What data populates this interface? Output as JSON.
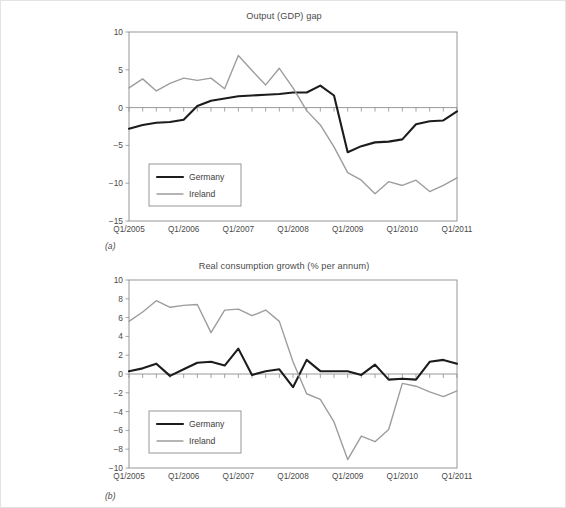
{
  "figure": {
    "panel_a_label": "(a)",
    "panel_b_label": "(b)"
  },
  "colors": {
    "germany": "#1c1c1c",
    "ireland": "#9d9d9d",
    "axis": "#8d8d8d",
    "text": "#4a4a4a",
    "background": "#ffffff"
  },
  "chart_data": [
    {
      "type": "line",
      "id": "output-gdp-gap",
      "title": "Output (GDP) gap",
      "xlabel": "",
      "ylabel": "",
      "ylim": [
        -15,
        10
      ],
      "yticks": [
        10,
        5,
        0,
        -5,
        -10,
        -15
      ],
      "ytick_labels": [
        "10",
        "5",
        "0",
        "−5",
        "−10",
        "−15"
      ],
      "grid": false,
      "legend_position": "lower-left",
      "x": [
        "Q1/2005",
        "Q2/2005",
        "Q3/2005",
        "Q4/2005",
        "Q1/2006",
        "Q2/2006",
        "Q3/2006",
        "Q4/2006",
        "Q1/2007",
        "Q2/2007",
        "Q3/2007",
        "Q4/2007",
        "Q1/2008",
        "Q2/2008",
        "Q3/2008",
        "Q4/2008",
        "Q1/2009",
        "Q2/2009",
        "Q3/2009",
        "Q4/2009",
        "Q1/2010",
        "Q2/2010",
        "Q3/2010",
        "Q4/2010",
        "Q1/2011"
      ],
      "xtick_labels": [
        "Q1/2005",
        "Q1/2006",
        "Q1/2007",
        "Q1/2008",
        "Q1/2009",
        "Q1/2010",
        "Q1/2011"
      ],
      "xtick_indices": [
        0,
        4,
        8,
        12,
        16,
        20,
        24
      ],
      "series": [
        {
          "name": "Germany",
          "color": "#1c1c1c",
          "width": 2.1,
          "values": [
            -2.8,
            -2.3,
            -2.0,
            -1.9,
            -1.6,
            0.2,
            0.9,
            1.2,
            1.5,
            1.6,
            1.7,
            1.8,
            2.0,
            2.0,
            2.9,
            1.6,
            -5.9,
            -5.1,
            -4.6,
            -4.5,
            -4.2,
            -2.2,
            -1.8,
            -1.7,
            -0.5
          ]
        },
        {
          "name": "Ireland",
          "color": "#9d9d9d",
          "width": 1.4,
          "values": [
            2.6,
            3.8,
            2.2,
            3.2,
            3.9,
            3.6,
            3.9,
            2.5,
            6.9,
            4.9,
            3.0,
            5.2,
            2.6,
            -0.4,
            -2.3,
            -5.2,
            -8.6,
            -9.6,
            -11.4,
            -9.8,
            -10.3,
            -9.6,
            -11.1,
            -10.3,
            -9.3
          ]
        }
      ],
      "legend": [
        "Germany",
        "Ireland"
      ]
    },
    {
      "type": "line",
      "id": "real-consumption-growth",
      "title": "Real consumption growth (% per annum)",
      "xlabel": "",
      "ylabel": "",
      "ylim": [
        -10,
        10
      ],
      "yticks": [
        10,
        8,
        6,
        4,
        2,
        0,
        -2,
        -4,
        -6,
        -8,
        -10
      ],
      "ytick_labels": [
        "10",
        "8",
        "6",
        "4",
        "2",
        "0",
        "−2",
        "−4",
        "−6",
        "−8",
        "−10"
      ],
      "grid": false,
      "legend_position": "lower-left",
      "x": [
        "Q1/2005",
        "Q2/2005",
        "Q3/2005",
        "Q4/2005",
        "Q1/2006",
        "Q2/2006",
        "Q3/2006",
        "Q4/2006",
        "Q1/2007",
        "Q2/2007",
        "Q3/2007",
        "Q4/2007",
        "Q1/2008",
        "Q2/2008",
        "Q3/2008",
        "Q4/2008",
        "Q1/2009",
        "Q2/2009",
        "Q3/2009",
        "Q4/2009",
        "Q1/2010",
        "Q2/2010",
        "Q3/2010",
        "Q4/2010",
        "Q1/2011"
      ],
      "xtick_labels": [
        "Q1/2005",
        "Q1/2006",
        "Q1/2007",
        "Q1/2008",
        "Q1/2009",
        "Q1/2010",
        "Q1/2011"
      ],
      "xtick_indices": [
        0,
        4,
        8,
        12,
        16,
        20,
        24
      ],
      "series": [
        {
          "name": "Germany",
          "color": "#1c1c1c",
          "width": 2.1,
          "values": [
            0.3,
            0.6,
            1.1,
            -0.2,
            0.5,
            1.2,
            1.3,
            0.9,
            2.7,
            -0.1,
            0.3,
            0.5,
            -1.4,
            1.5,
            0.3,
            0.3,
            0.3,
            -0.1,
            1.0,
            -0.6,
            -0.5,
            -0.6,
            1.3,
            1.5,
            1.1
          ]
        },
        {
          "name": "Ireland",
          "color": "#9d9d9d",
          "width": 1.4,
          "values": [
            5.6,
            6.6,
            7.8,
            7.1,
            7.3,
            7.4,
            4.4,
            6.8,
            6.9,
            6.2,
            6.8,
            5.6,
            1.3,
            -2.1,
            -2.7,
            -5.1,
            -9.1,
            -6.6,
            -7.2,
            -5.9,
            -1.0,
            -1.3,
            -1.9,
            -2.4,
            -1.8
          ]
        }
      ],
      "legend": [
        "Germany",
        "Ireland"
      ]
    }
  ]
}
